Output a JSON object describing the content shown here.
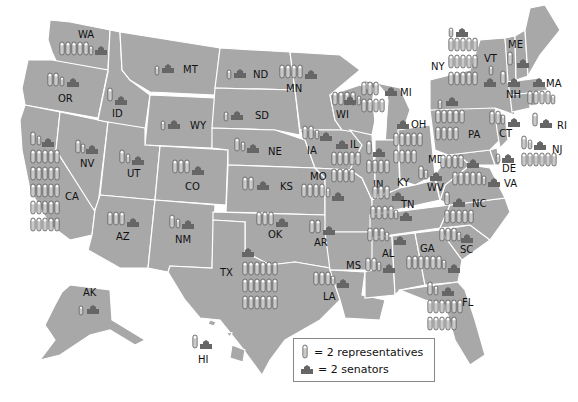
{
  "colors": {
    "land": "#a8a8a8",
    "border": "#ffffff",
    "rep_fill": "#c9c9c9",
    "rep_stroke": "#555555",
    "senate": "#666666",
    "background": "#ffffff"
  },
  "legend": {
    "representatives_label": "= 2 representatives",
    "senators_label": "= 2 senators",
    "representative_icon": "capsule-icon",
    "senator_icon": "capitol-building-icon"
  },
  "states": [
    {
      "abbr": "WA",
      "rep_icons": 5,
      "half_rep": true,
      "senate_icons": 1
    },
    {
      "abbr": "OR",
      "rep_icons": 2,
      "half_rep": true,
      "senate_icons": 1
    },
    {
      "abbr": "CA",
      "rep_icons": 26,
      "half_rep": true,
      "senate_icons": 1
    },
    {
      "abbr": "NV",
      "rep_icons": 1,
      "half_rep": true,
      "senate_icons": 1
    },
    {
      "abbr": "ID",
      "rep_icons": 1,
      "half_rep": false,
      "senate_icons": 1
    },
    {
      "abbr": "MT",
      "rep_icons": 0,
      "half_rep": true,
      "senate_icons": 1
    },
    {
      "abbr": "WY",
      "rep_icons": 0,
      "half_rep": true,
      "senate_icons": 1
    },
    {
      "abbr": "UT",
      "rep_icons": 1,
      "half_rep": true,
      "senate_icons": 1
    },
    {
      "abbr": "CO",
      "rep_icons": 3,
      "half_rep": true,
      "senate_icons": 1
    },
    {
      "abbr": "AZ",
      "rep_icons": 4,
      "half_rep": false,
      "senate_icons": 1
    },
    {
      "abbr": "NM",
      "rep_icons": 1,
      "half_rep": true,
      "senate_icons": 1
    },
    {
      "abbr": "ND",
      "rep_icons": 0,
      "half_rep": true,
      "senate_icons": 1
    },
    {
      "abbr": "SD",
      "rep_icons": 0,
      "half_rep": true,
      "senate_icons": 1
    },
    {
      "abbr": "NE",
      "rep_icons": 1,
      "half_rep": true,
      "senate_icons": 1
    },
    {
      "abbr": "KS",
      "rep_icons": 2,
      "half_rep": false,
      "senate_icons": 1
    },
    {
      "abbr": "OK",
      "rep_icons": 2,
      "half_rep": true,
      "senate_icons": 1
    },
    {
      "abbr": "TX",
      "rep_icons": 18,
      "half_rep": false,
      "senate_icons": 1
    },
    {
      "abbr": "MN",
      "rep_icons": 4,
      "half_rep": false,
      "senate_icons": 1
    },
    {
      "abbr": "IA",
      "rep_icons": 2,
      "half_rep": false,
      "senate_icons": 1
    },
    {
      "abbr": "MO",
      "rep_icons": 4,
      "half_rep": true,
      "senate_icons": 1
    },
    {
      "abbr": "AR",
      "rep_icons": 2,
      "half_rep": false,
      "senate_icons": 1
    },
    {
      "abbr": "LA",
      "rep_icons": 3,
      "half_rep": true,
      "senate_icons": 1
    },
    {
      "abbr": "WI",
      "rep_icons": 4,
      "half_rep": true,
      "senate_icons": 1
    },
    {
      "abbr": "IL",
      "rep_icons": 9,
      "half_rep": false,
      "senate_icons": 1
    },
    {
      "abbr": "MI",
      "rep_icons": 7,
      "half_rep": false,
      "senate_icons": 1
    },
    {
      "abbr": "IN",
      "rep_icons": 4,
      "half_rep": true,
      "senate_icons": 1
    },
    {
      "abbr": "OH",
      "rep_icons": 9,
      "half_rep": false,
      "senate_icons": 1
    },
    {
      "abbr": "KY",
      "rep_icons": 3,
      "half_rep": false,
      "senate_icons": 1
    },
    {
      "abbr": "TN",
      "rep_icons": 4,
      "half_rep": true,
      "senate_icons": 1
    },
    {
      "abbr": "MS",
      "rep_icons": 2,
      "half_rep": false,
      "senate_icons": 1
    },
    {
      "abbr": "AL",
      "rep_icons": 3,
      "half_rep": true,
      "senate_icons": 1
    },
    {
      "abbr": "GA",
      "rep_icons": 6,
      "half_rep": true,
      "senate_icons": 1
    },
    {
      "abbr": "FL",
      "rep_icons": 12,
      "half_rep": true,
      "senate_icons": 1
    },
    {
      "abbr": "SC",
      "rep_icons": 3,
      "half_rep": true,
      "senate_icons": 1
    },
    {
      "abbr": "NC",
      "rep_icons": 6,
      "half_rep": true,
      "senate_icons": 1
    },
    {
      "abbr": "VA",
      "rep_icons": 5,
      "half_rep": true,
      "senate_icons": 1
    },
    {
      "abbr": "WV",
      "rep_icons": 1,
      "half_rep": true,
      "senate_icons": 1
    },
    {
      "abbr": "MD",
      "rep_icons": 4,
      "half_rep": false,
      "senate_icons": 1
    },
    {
      "abbr": "DE",
      "rep_icons": 0,
      "half_rep": true,
      "senate_icons": 1
    },
    {
      "abbr": "PA",
      "rep_icons": 9,
      "half_rep": true,
      "senate_icons": 1
    },
    {
      "abbr": "NJ",
      "rep_icons": 6,
      "half_rep": true,
      "senate_icons": 1
    },
    {
      "abbr": "NY",
      "rep_icons": 14,
      "half_rep": true,
      "senate_icons": 1
    },
    {
      "abbr": "CT",
      "rep_icons": 2,
      "half_rep": true,
      "senate_icons": 1
    },
    {
      "abbr": "RI",
      "rep_icons": 1,
      "half_rep": false,
      "senate_icons": 1
    },
    {
      "abbr": "MA",
      "rep_icons": 4,
      "half_rep": true,
      "senate_icons": 1
    },
    {
      "abbr": "VT",
      "rep_icons": 0,
      "half_rep": true,
      "senate_icons": 1
    },
    {
      "abbr": "NH",
      "rep_icons": 1,
      "half_rep": false,
      "senate_icons": 1
    },
    {
      "abbr": "ME",
      "rep_icons": 1,
      "half_rep": false,
      "senate_icons": 1
    },
    {
      "abbr": "AK",
      "rep_icons": 0,
      "half_rep": true,
      "senate_icons": 1
    },
    {
      "abbr": "HI",
      "rep_icons": 1,
      "half_rep": false,
      "senate_icons": 1
    }
  ],
  "labels": {
    "WA": "WA",
    "OR": "OR",
    "CA": "CA",
    "NV": "NV",
    "ID": "ID",
    "MT": "MT",
    "WY": "WY",
    "UT": "UT",
    "CO": "CO",
    "AZ": "AZ",
    "NM": "NM",
    "ND": "ND",
    "SD": "SD",
    "NE": "NE",
    "KS": "KS",
    "OK": "OK",
    "TX": "TX",
    "MN": "MN",
    "IA": "IA",
    "MO": "MO",
    "AR": "AR",
    "LA": "LA",
    "WI": "WI",
    "IL": "IL",
    "MI": "MI",
    "IN": "IN",
    "OH": "OH",
    "KY": "KY",
    "TN": "TN",
    "MS": "MS",
    "AL": "AL",
    "GA": "GA",
    "FL": "FL",
    "SC": "SC",
    "NC": "NC",
    "VA": "VA",
    "WV": "WV",
    "MD": "MD",
    "DE": "DE",
    "PA": "PA",
    "NJ": "NJ",
    "NY": "NY",
    "CT": "CT",
    "RI": "RI",
    "MA": "MA",
    "VT": "VT",
    "NH": "NH",
    "ME": "ME",
    "AK": "AK",
    "HI": "HI"
  }
}
